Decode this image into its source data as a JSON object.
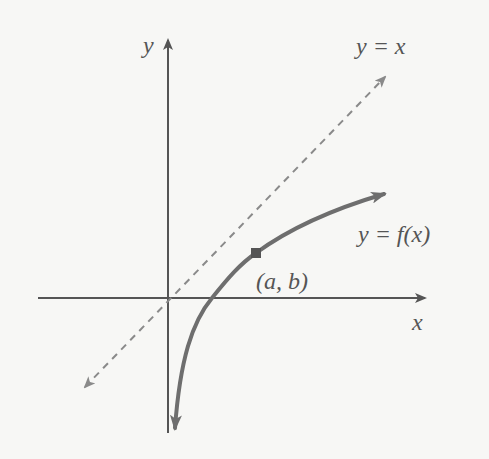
{
  "diagram": {
    "type": "function-graph",
    "colors": {
      "background": "#f7f7f5",
      "axis": "#555555",
      "curve": "#6e6e6e",
      "dashed_line": "#8a8a8a",
      "point": "#555555",
      "text": "#555555"
    },
    "labels": {
      "y_axis": "y",
      "x_axis": "x",
      "identity_line": "y = x",
      "function": "y = f(x)",
      "point": "(a, b)"
    },
    "elements": [
      {
        "id": "x-axis",
        "kind": "arrow",
        "direction": "right"
      },
      {
        "id": "y-axis",
        "kind": "arrow",
        "direction": "up"
      },
      {
        "id": "identity-line",
        "kind": "dashed-line",
        "equation": "y = x",
        "arrows": "both"
      },
      {
        "id": "function-curve",
        "kind": "curve",
        "equation": "y = f(x)",
        "arrows": "both",
        "shape": "increasing, concave down, vertical asymptote at x=0 going down"
      },
      {
        "id": "point-ab",
        "kind": "point",
        "label": "(a, b)",
        "on": "function-curve"
      }
    ]
  }
}
